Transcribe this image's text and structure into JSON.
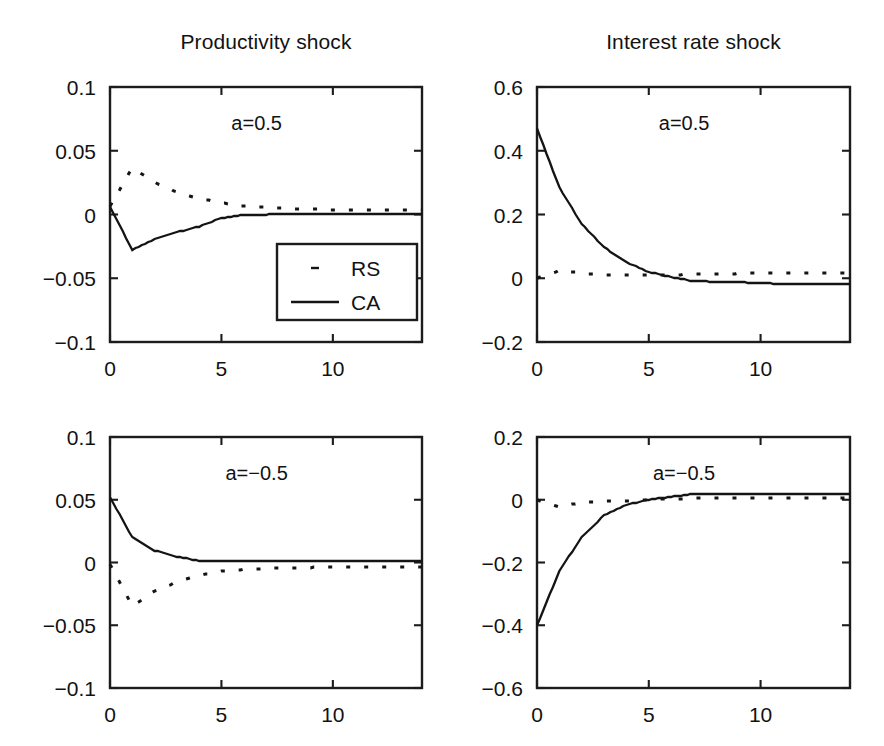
{
  "figure": {
    "background": "#ffffff",
    "ink_color": "#141414",
    "width": 884,
    "height": 746
  },
  "titles": {
    "left": "Productivity shock",
    "right": "Interest rate shock"
  },
  "legend": {
    "entries": [
      {
        "key": "RS",
        "label": "RS",
        "style": "dotted"
      },
      {
        "key": "CA",
        "label": "CA",
        "style": "solid"
      }
    ],
    "panel": "top-left"
  },
  "chart_data": [
    {
      "id": "productivity-a-positive",
      "type": "line",
      "title": "Productivity shock",
      "annotation": "a=0.5",
      "xlabel": "",
      "ylabel": "",
      "xlim": [
        0,
        14
      ],
      "ylim": [
        -0.1,
        0.1
      ],
      "xticks": [
        0,
        5,
        10
      ],
      "xticklabels": [
        "0",
        "5",
        "10"
      ],
      "yticks": [
        -0.1,
        -0.05,
        0,
        0.05,
        0.1
      ],
      "yticklabels": [
        "−0.1",
        "−0.05",
        "0",
        "0.05",
        "0.1"
      ],
      "grid": false,
      "legend": "inside-lower-right",
      "x": [
        0,
        1,
        2,
        3,
        4,
        5,
        6,
        7,
        8,
        9,
        10,
        11,
        12,
        13,
        14
      ],
      "series": [
        {
          "name": "RS",
          "style": "dotted",
          "values": [
            0.0065,
            0.0365,
            0.0253,
            0.0175,
            0.0125,
            0.009,
            0.0067,
            0.0055,
            0.0047,
            0.0042,
            0.0038,
            0.0036,
            0.0034,
            0.0033,
            0.0032
          ]
        },
        {
          "name": "CA",
          "style": "solid",
          "values": [
            0.006,
            -0.0278,
            -0.0196,
            -0.0138,
            -0.0095,
            -0.0027,
            -0.0004,
            0.0,
            0.0001,
            0.0002,
            0.0002,
            0.0002,
            0.0002,
            0.0002,
            0.0002
          ]
        }
      ]
    },
    {
      "id": "interest-rate-a-positive",
      "type": "line",
      "title": "Interest rate shock",
      "annotation": "a=0.5",
      "xlabel": "",
      "ylabel": "",
      "xlim": [
        0,
        14
      ],
      "ylim": [
        -0.2,
        0.6
      ],
      "xticks": [
        0,
        5,
        10
      ],
      "xticklabels": [
        "0",
        "5",
        "10"
      ],
      "yticks": [
        -0.2,
        0,
        0.2,
        0.4,
        0.6
      ],
      "yticklabels": [
        "−0.2",
        "0",
        "0.2",
        "0.4",
        "0.6"
      ],
      "grid": false,
      "legend": "none",
      "x": [
        0,
        1,
        2,
        3,
        4,
        5,
        6,
        7,
        8,
        9,
        10,
        11,
        12,
        13,
        14
      ],
      "series": [
        {
          "name": "RS",
          "style": "dotted",
          "values": [
            0.0,
            0.0245,
            0.016,
            0.0115,
            0.009,
            0.01,
            0.011,
            0.0125,
            0.014,
            0.015,
            0.0158,
            0.0162,
            0.0165,
            0.0168,
            0.017
          ]
        },
        {
          "name": "CA",
          "style": "solid",
          "values": [
            0.47,
            0.285,
            0.17,
            0.097,
            0.05,
            0.02,
            0.004,
            -0.009,
            -0.011,
            -0.012,
            -0.016,
            -0.017,
            -0.017,
            -0.017,
            -0.017
          ]
        }
      ]
    },
    {
      "id": "productivity-a-negative",
      "type": "line",
      "title": "Productivity shock",
      "annotation": "a=−0.5",
      "xlabel": "",
      "ylabel": "",
      "xlim": [
        0,
        14
      ],
      "ylim": [
        -0.1,
        0.1
      ],
      "xticks": [
        0,
        5,
        10
      ],
      "xticklabels": [
        "0",
        "5",
        "10"
      ],
      "yticks": [
        -0.1,
        -0.05,
        0,
        0.05,
        0.1
      ],
      "yticklabels": [
        "−0.1",
        "−0.05",
        "0",
        "0.05",
        "0.1"
      ],
      "grid": false,
      "legend": "none",
      "x": [
        0,
        1,
        2,
        3,
        4,
        5,
        6,
        7,
        8,
        9,
        10,
        11,
        12,
        13,
        14
      ],
      "series": [
        {
          "name": "RS",
          "style": "dotted",
          "values": [
            -0.0015,
            -0.0345,
            -0.023,
            -0.0155,
            -0.0105,
            -0.007,
            -0.0055,
            -0.0048,
            -0.0043,
            -0.004,
            -0.0038,
            -0.0036,
            -0.0035,
            -0.0034,
            -0.0034
          ]
        },
        {
          "name": "CA",
          "style": "solid",
          "values": [
            0.052,
            0.02,
            0.0095,
            0.0045,
            0.0015,
            0.0012,
            0.0012,
            0.0012,
            0.0012,
            0.0012,
            0.0012,
            0.0012,
            0.0012,
            0.0012,
            0.0012
          ]
        }
      ]
    },
    {
      "id": "interest-rate-a-negative",
      "type": "line",
      "title": "Interest rate shock",
      "annotation": "a=−0.5",
      "xlabel": "",
      "ylabel": "",
      "xlim": [
        0,
        14
      ],
      "ylim": [
        -0.6,
        0.2
      ],
      "xticks": [
        0,
        5,
        10
      ],
      "xticklabels": [
        "0",
        "5",
        "10"
      ],
      "yticks": [
        -0.6,
        -0.4,
        -0.2,
        0,
        0.2
      ],
      "yticklabels": [
        "−0.6",
        "−0.4",
        "−0.2",
        "0",
        "0.2"
      ],
      "grid": false,
      "legend": "none",
      "x": [
        0,
        1,
        2,
        3,
        4,
        5,
        6,
        7,
        8,
        9,
        10,
        11,
        12,
        13,
        14
      ],
      "series": [
        {
          "name": "RS",
          "style": "dotted",
          "values": [
            0.0,
            -0.022,
            -0.009,
            -0.005,
            -0.0035,
            0.0,
            0.003,
            0.0045,
            0.0055,
            0.006,
            0.0062,
            0.0064,
            0.0066,
            0.0068,
            0.007
          ]
        },
        {
          "name": "CA",
          "style": "solid",
          "values": [
            -0.4,
            -0.228,
            -0.118,
            -0.05,
            -0.016,
            0.0,
            0.01,
            0.018,
            0.019,
            0.019,
            0.019,
            0.019,
            0.019,
            0.019,
            0.019
          ]
        }
      ]
    }
  ],
  "panel_geometry": [
    {
      "id": "productivity-a-positive",
      "left": 110,
      "top": 87,
      "width": 312,
      "height": 255
    },
    {
      "id": "interest-rate-a-positive",
      "left": 537,
      "top": 87,
      "width": 313,
      "height": 255
    },
    {
      "id": "productivity-a-negative",
      "left": 110,
      "top": 437,
      "width": 312,
      "height": 251
    },
    {
      "id": "interest-rate-a-negative",
      "left": 537,
      "top": 437,
      "width": 313,
      "height": 251
    }
  ]
}
